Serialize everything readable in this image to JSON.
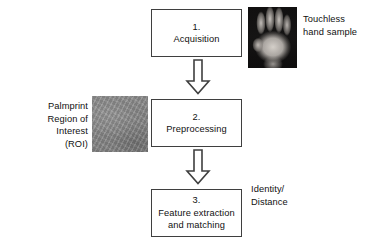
{
  "diagram": {
    "background_color": "#ffffff",
    "box_border_color": "#3f3f3f",
    "text_color": "#111111"
  },
  "steps": [
    {
      "number": "1.",
      "label": "Acquisition"
    },
    {
      "number": "2.",
      "label": "Preprocessing"
    },
    {
      "number": "3.",
      "label": "Feature extraction\nand matching"
    }
  ],
  "connectors": [
    {
      "name": "arrow-acquisition-to-preprocessing",
      "direction": "down"
    },
    {
      "name": "arrow-preprocessing-to-feature",
      "direction": "down"
    }
  ],
  "annotations": {
    "hand_sample": "Touchless\nhand sample",
    "roi": "Palmprint\nRegion of Interest\n(ROI)",
    "output": "Identity/\nDistance"
  },
  "images": {
    "hand_sample": {
      "name": "touchless-hand-sample-image",
      "description": "grayscale photo of an open hand, palm facing camera, fingers spread, on a dark background",
      "background_color": "#121111",
      "foreground_color": "#d6d1cb"
    },
    "roi": {
      "name": "palmprint-roi-image",
      "description": "cropped square gray palmprint region of interest texture",
      "background_color": "#8a8a8a"
    }
  }
}
